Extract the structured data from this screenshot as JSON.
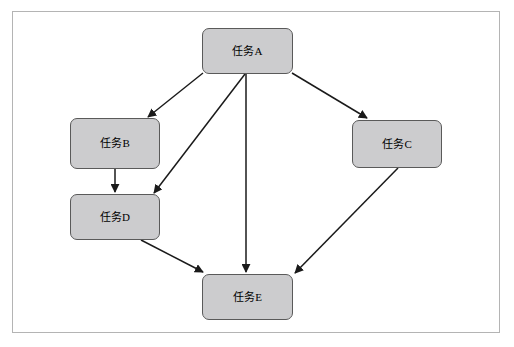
{
  "diagram": {
    "type": "flowchart",
    "title": "",
    "background_color": "#ffffff",
    "frame": {
      "name": "page-border",
      "border_color": "#b4b4b4"
    },
    "node_style": {
      "fill": "#ccccce",
      "stroke": "#5a5a5a",
      "text_color": "#000000",
      "shape": "rounded-rectangle"
    },
    "edge_style": {
      "stroke": "#1a1a1a",
      "arrowhead": "filled-triangle"
    },
    "nodes": [
      {
        "id": "A",
        "label": "任务A"
      },
      {
        "id": "B",
        "label": "任务B"
      },
      {
        "id": "C",
        "label": "任务C"
      },
      {
        "id": "D",
        "label": "任务D"
      },
      {
        "id": "E",
        "label": "任务E"
      }
    ],
    "edges": [
      {
        "from": "A",
        "to": "B",
        "label": ""
      },
      {
        "from": "A",
        "to": "C",
        "label": ""
      },
      {
        "from": "A",
        "to": "D",
        "label": ""
      },
      {
        "from": "A",
        "to": "E",
        "label": ""
      },
      {
        "from": "B",
        "to": "D",
        "label": ""
      },
      {
        "from": "C",
        "to": "E",
        "label": ""
      },
      {
        "from": "D",
        "to": "E",
        "label": ""
      }
    ]
  }
}
